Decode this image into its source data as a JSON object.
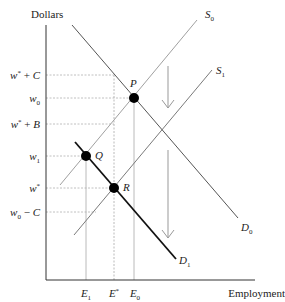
{
  "diagram": {
    "y_axis_label": "Dollars",
    "x_axis_label": "Employment",
    "y_ticks": [
      {
        "id": "wstar_plus_C",
        "base": "w",
        "sup": "*",
        "suffix": " + C",
        "y": 76
      },
      {
        "id": "w0",
        "base": "w",
        "sub": "0",
        "y": 98
      },
      {
        "id": "wstar_plus_B",
        "base": "w",
        "sup": "*",
        "suffix": " + B",
        "y": 124
      },
      {
        "id": "w1",
        "base": "w",
        "sub": "1",
        "y": 156
      },
      {
        "id": "wstar",
        "base": "w",
        "sup": "*",
        "y": 188
      },
      {
        "id": "w0_minus_C",
        "base": "w",
        "sub": "0",
        "suffix": " − C",
        "y": 212
      }
    ],
    "x_ticks": [
      {
        "id": "E1",
        "base": "E",
        "sub": "1",
        "x": 86
      },
      {
        "id": "Estar",
        "base": "E",
        "sup": "*",
        "x": 114
      },
      {
        "id": "E0",
        "base": "E",
        "sub": "0",
        "x": 134
      }
    ],
    "curves": [
      {
        "id": "S0",
        "label": "S",
        "sub": "0",
        "color": "#9a9a9a"
      },
      {
        "id": "S1",
        "label": "S",
        "sub": "1",
        "color": "#777777"
      },
      {
        "id": "D0",
        "label": "D",
        "sub": "0",
        "color": "#555555"
      },
      {
        "id": "D1",
        "label": "D",
        "sub": "1",
        "color": "#111111"
      }
    ],
    "points": [
      {
        "id": "P",
        "label": "P"
      },
      {
        "id": "Q",
        "label": "Q"
      },
      {
        "id": "R",
        "label": "R"
      }
    ],
    "arrows": [
      "upper-shift-down-arrow",
      "lower-shift-down-arrow"
    ]
  }
}
